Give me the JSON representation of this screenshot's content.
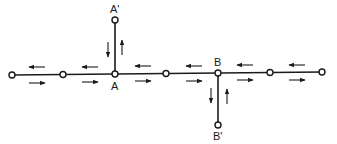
{
  "diagram": {
    "colors": {
      "line": "#1a1a1a",
      "node_fill": "#ffffff",
      "background": "#ffffff"
    },
    "nodes": [
      {
        "id": "n1",
        "x": 12,
        "y": 75,
        "label": ""
      },
      {
        "id": "n2",
        "x": 63,
        "y": 74.5,
        "label": ""
      },
      {
        "id": "A",
        "x": 115,
        "y": 74,
        "label": "A"
      },
      {
        "id": "n4",
        "x": 166,
        "y": 73.5,
        "label": ""
      },
      {
        "id": "B",
        "x": 218,
        "y": 73,
        "label": "B"
      },
      {
        "id": "n6",
        "x": 270,
        "y": 72.5,
        "label": ""
      },
      {
        "id": "n7",
        "x": 322,
        "y": 72,
        "label": ""
      },
      {
        "id": "A'",
        "x": 115,
        "y": 20,
        "label": "A'"
      },
      {
        "id": "B'",
        "x": 218,
        "y": 125,
        "label": "B'"
      }
    ],
    "labels": {
      "A": "A",
      "A_prime": "A'",
      "B": "B",
      "B_prime": "B'"
    },
    "edges": [
      {
        "from": "n1",
        "to": "n2",
        "arrows": [
          "left",
          "right"
        ]
      },
      {
        "from": "n2",
        "to": "A",
        "arrows": [
          "left",
          "right"
        ]
      },
      {
        "from": "A",
        "to": "n4",
        "arrows": [
          "left",
          "right"
        ]
      },
      {
        "from": "n4",
        "to": "B",
        "arrows": [
          "left",
          "right"
        ]
      },
      {
        "from": "B",
        "to": "n6",
        "arrows": [
          "left",
          "right"
        ]
      },
      {
        "from": "n6",
        "to": "n7",
        "arrows": [
          "left",
          "right"
        ]
      },
      {
        "from": "A",
        "to": "A'",
        "arrows": [
          "down",
          "up"
        ]
      },
      {
        "from": "B",
        "to": "B'",
        "arrows": [
          "down",
          "up"
        ]
      }
    ]
  }
}
